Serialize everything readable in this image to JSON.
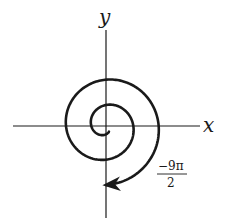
{
  "figure": {
    "type": "archimedean-spiral",
    "axes": {
      "x_label": "x",
      "y_label": "y"
    },
    "annotation": {
      "numerator": "−9π",
      "denominator": "2"
    },
    "colors": {
      "stroke": "#1a1a1a",
      "background": "#ffffff"
    }
  }
}
